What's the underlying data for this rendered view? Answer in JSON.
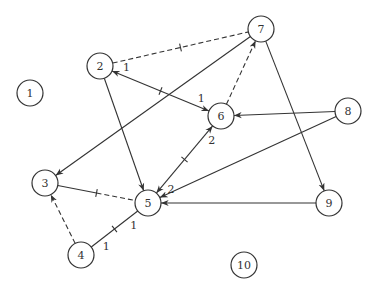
{
  "diagram": {
    "type": "graph",
    "nodes": [
      {
        "id": "1",
        "label": "1",
        "x": 30,
        "y": 93
      },
      {
        "id": "2",
        "label": "2",
        "x": 100,
        "y": 66
      },
      {
        "id": "3",
        "label": "3",
        "x": 45,
        "y": 183
      },
      {
        "id": "4",
        "label": "4",
        "x": 81,
        "y": 255
      },
      {
        "id": "5",
        "label": "5",
        "x": 148,
        "y": 203
      },
      {
        "id": "6",
        "label": "6",
        "x": 221,
        "y": 116
      },
      {
        "id": "7",
        "label": "7",
        "x": 261,
        "y": 29
      },
      {
        "id": "8",
        "label": "8",
        "x": 348,
        "y": 111
      },
      {
        "id": "9",
        "label": "9",
        "x": 329,
        "y": 203
      },
      {
        "id": "10",
        "label": "10",
        "x": 244,
        "y": 265
      }
    ],
    "edges": [
      {
        "from": "2",
        "to": "7",
        "style": "dashed",
        "arrow_start": false,
        "arrow_end": false,
        "tick": true
      },
      {
        "from": "6",
        "to": "2",
        "style": "solid",
        "arrow_start": true,
        "arrow_end": true,
        "tick": true,
        "label_start": "1",
        "label_end": "1"
      },
      {
        "from": "2",
        "to": "5",
        "style": "solid",
        "arrow_start": false,
        "arrow_end": true,
        "tick": false
      },
      {
        "from": "7",
        "to": "3",
        "style": "solid",
        "arrow_start": false,
        "arrow_end": true,
        "tick": false
      },
      {
        "from": "6",
        "to": "7",
        "style": "dashed",
        "arrow_start": false,
        "arrow_end": true,
        "tick": false
      },
      {
        "from": "7",
        "to": "9",
        "style": "solid",
        "arrow_start": false,
        "arrow_end": true,
        "tick": false
      },
      {
        "from": "8",
        "to": "6",
        "style": "solid",
        "arrow_start": false,
        "arrow_end": true,
        "tick": false
      },
      {
        "from": "8",
        "to": "5",
        "style": "solid",
        "arrow_start": false,
        "arrow_end": true,
        "tick": false
      },
      {
        "from": "9",
        "to": "5",
        "style": "solid",
        "arrow_start": false,
        "arrow_end": true,
        "tick": false
      },
      {
        "from": "5",
        "to": "6",
        "style": "solid",
        "arrow_start": true,
        "arrow_end": true,
        "tick": true,
        "label_start": "2",
        "label_end": "2"
      },
      {
        "from": "3",
        "to": "5",
        "style": "half-solid-half-dashed",
        "arrow_start": false,
        "arrow_end": false,
        "tick": true
      },
      {
        "from": "4",
        "to": "3",
        "style": "dashed",
        "arrow_start": false,
        "arrow_end": true,
        "tick": false
      },
      {
        "from": "4",
        "to": "5",
        "style": "solid",
        "arrow_start": false,
        "arrow_end": false,
        "tick": true,
        "label_start": "1",
        "label_end": "1"
      }
    ]
  }
}
